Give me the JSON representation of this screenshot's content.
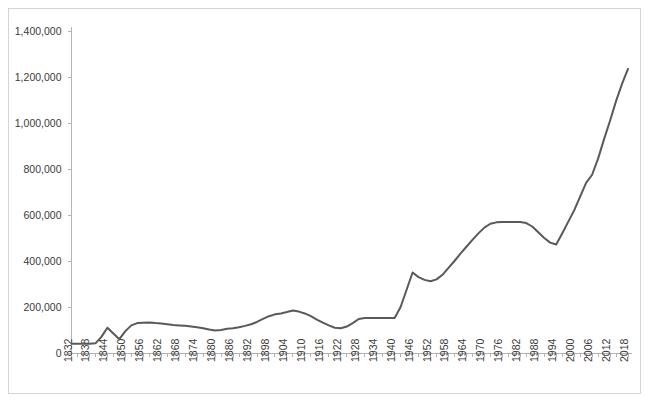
{
  "chart_data": {
    "type": "line",
    "title": "",
    "subtitle": "",
    "xlabel": "",
    "ylabel": "",
    "xlim": [
      1832,
      2018
    ],
    "ylim": [
      0,
      1400000
    ],
    "grid": false,
    "legend": false,
    "legend_position": "none",
    "line_color": "#595959",
    "axis_color": "#b3b3b3",
    "border_color": "#d4d4d4",
    "y_ticks": [
      0,
      200000,
      400000,
      600000,
      800000,
      1000000,
      1200000,
      1400000
    ],
    "y_tick_labels": [
      "0",
      "200,000",
      "400,000",
      "600,000",
      "800,000",
      "1,000,000",
      "1,200,000",
      "1,400,000"
    ],
    "x_tick_labels": [
      "1832",
      "1838",
      "1844",
      "1850",
      "1856",
      "1862",
      "1868",
      "1874",
      "1880",
      "1886",
      "1892",
      "1898",
      "1904",
      "1910",
      "1916",
      "1922",
      "1928",
      "1934",
      "1940",
      "1946",
      "1952",
      "1958",
      "1964",
      "1970",
      "1976",
      "1982",
      "1988",
      "1994",
      "2000",
      "2006",
      "2012",
      "2018"
    ],
    "x_tick_step": 6,
    "minor_tick_step": 2,
    "series": [
      {
        "name": "series-1",
        "color": "#595959",
        "x": [
          1832,
          1834,
          1836,
          1838,
          1840,
          1842,
          1844,
          1846,
          1848,
          1850,
          1852,
          1854,
          1856,
          1858,
          1860,
          1862,
          1864,
          1866,
          1868,
          1870,
          1872,
          1874,
          1876,
          1878,
          1880,
          1882,
          1884,
          1886,
          1888,
          1890,
          1892,
          1894,
          1896,
          1898,
          1900,
          1902,
          1904,
          1906,
          1908,
          1910,
          1912,
          1914,
          1916,
          1918,
          1920,
          1922,
          1924,
          1926,
          1928,
          1930,
          1932,
          1934,
          1936,
          1938,
          1940,
          1942,
          1944,
          1946,
          1948,
          1950,
          1952,
          1954,
          1956,
          1958,
          1960,
          1962,
          1964,
          1966,
          1968,
          1970,
          1972,
          1974,
          1976,
          1978,
          1980,
          1982,
          1984,
          1986,
          1988,
          1990,
          1992,
          1994,
          1996,
          1998,
          2000,
          2002,
          2004,
          2006,
          2008,
          2010,
          2012,
          2014,
          2016,
          2018
        ],
        "values": [
          40000,
          40000,
          40000,
          40000,
          42000,
          70000,
          110000,
          85000,
          60000,
          95000,
          120000,
          130000,
          132000,
          133000,
          130000,
          128000,
          125000,
          122000,
          120000,
          118000,
          115000,
          112000,
          108000,
          102000,
          98000,
          100000,
          105000,
          108000,
          112000,
          118000,
          125000,
          135000,
          148000,
          160000,
          168000,
          172000,
          178000,
          185000,
          180000,
          172000,
          160000,
          145000,
          132000,
          120000,
          110000,
          108000,
          115000,
          130000,
          148000,
          152000,
          152000,
          152000,
          152000,
          152000,
          152000,
          200000,
          275000,
          350000,
          330000,
          318000,
          312000,
          320000,
          340000,
          370000,
          400000,
          432000,
          462000,
          492000,
          520000,
          545000,
          562000,
          568000,
          570000,
          570000,
          570000,
          570000,
          565000,
          550000,
          525000,
          500000,
          480000,
          472000,
          520000,
          570000,
          620000,
          680000,
          740000,
          775000,
          845000,
          930000,
          1010000,
          1095000,
          1170000,
          1235000
        ]
      }
    ]
  }
}
